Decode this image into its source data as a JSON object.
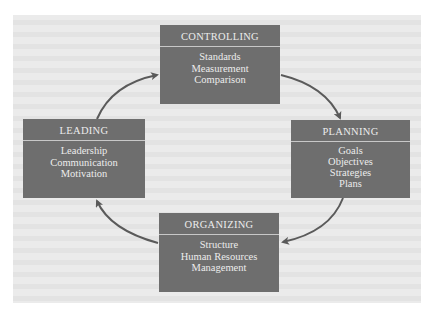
{
  "diagram": {
    "type": "cycle",
    "colors": {
      "background": "#ffffff",
      "panel": "#ebebeb",
      "box_fill": "#6e6e6e",
      "box_text": "#ececec",
      "divider": "#c8c8c8",
      "arrow": "#5a5a5a"
    },
    "nodes": [
      {
        "id": "controlling",
        "title": "CONTROLLING",
        "items": [
          "Standards",
          "Measurement",
          "Comparison"
        ]
      },
      {
        "id": "planning",
        "title": "PLANNING",
        "items": [
          "Goals",
          "Objectives",
          "Strategies",
          "Plans"
        ]
      },
      {
        "id": "organizing",
        "title": "ORGANIZING",
        "items": [
          "Structure",
          "Human Resources",
          "Management"
        ]
      },
      {
        "id": "leading",
        "title": "LEADING",
        "items": [
          "Leadership",
          "Communication",
          "Motivation"
        ]
      }
    ],
    "edges": [
      {
        "from": "leading",
        "to": "controlling"
      },
      {
        "from": "controlling",
        "to": "planning"
      },
      {
        "from": "planning",
        "to": "organizing"
      },
      {
        "from": "organizing",
        "to": "leading"
      }
    ]
  }
}
